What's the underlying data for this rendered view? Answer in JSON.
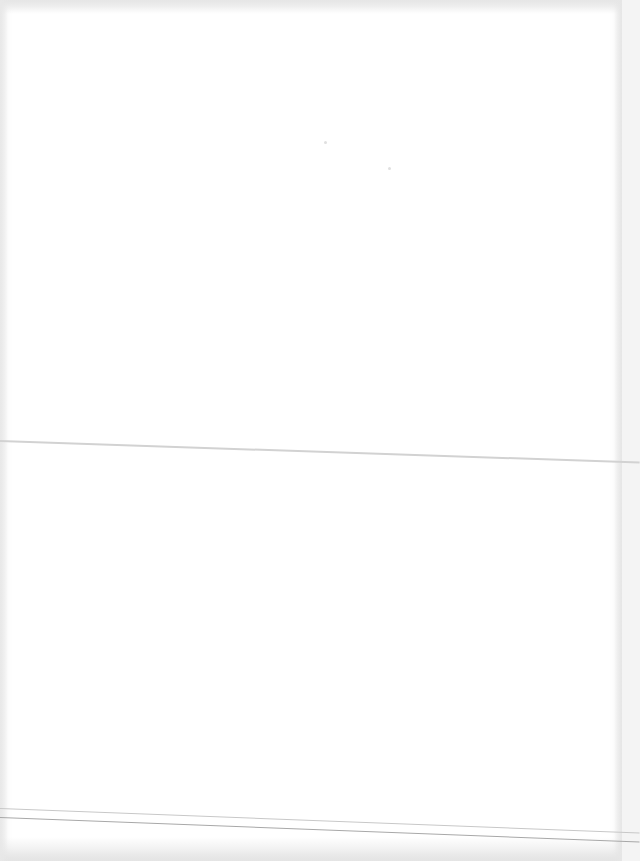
{
  "document": {
    "type": "blank scanned page",
    "text": "",
    "features": {
      "fold_line": true,
      "bottom_rule_lines": 2
    },
    "colors": {
      "paper": "#ffffff",
      "edge_shadow": "#e6e6e6",
      "fold_line": "#d2d2d2",
      "rule_line_light": "#c8c8c8",
      "rule_line_dark": "#a8a8a8"
    }
  }
}
